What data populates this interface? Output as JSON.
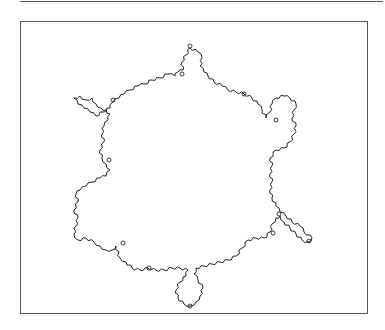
{
  "figure": {
    "stroke_color": "#222222",
    "frame_color": "#555555",
    "background": "#ffffff",
    "outline_points": [
      [
        190,
        48
      ],
      [
        186,
        55
      ],
      [
        182,
        62
      ],
      [
        183,
        70
      ],
      [
        178,
        72
      ],
      [
        175,
        76
      ],
      [
        168,
        74
      ],
      [
        160,
        78
      ],
      [
        152,
        80
      ],
      [
        145,
        84
      ],
      [
        138,
        86
      ],
      [
        130,
        90
      ],
      [
        124,
        94
      ],
      [
        119,
        98
      ],
      [
        113,
        102
      ],
      [
        110,
        108
      ],
      [
        103,
        112
      ],
      [
        96,
        116
      ],
      [
        90,
        112
      ],
      [
        84,
        108
      ],
      [
        78,
        104
      ],
      [
        74,
        98
      ],
      [
        80,
        96
      ],
      [
        86,
        100
      ],
      [
        92,
        98
      ],
      [
        96,
        104
      ],
      [
        101,
        108
      ],
      [
        106,
        110
      ],
      [
        110,
        114
      ],
      [
        108,
        120
      ],
      [
        104,
        126
      ],
      [
        102,
        134
      ],
      [
        104,
        142
      ],
      [
        100,
        150
      ],
      [
        102,
        158
      ],
      [
        106,
        164
      ],
      [
        110,
        170
      ],
      [
        106,
        176
      ],
      [
        100,
        178
      ],
      [
        92,
        182
      ],
      [
        86,
        186
      ],
      [
        80,
        190
      ],
      [
        76,
        194
      ],
      [
        78,
        202
      ],
      [
        74,
        210
      ],
      [
        78,
        218
      ],
      [
        76,
        226
      ],
      [
        74,
        234
      ],
      [
        78,
        240
      ],
      [
        86,
        238
      ],
      [
        94,
        242
      ],
      [
        100,
        246
      ],
      [
        106,
        250
      ],
      [
        112,
        250
      ],
      [
        116,
        246
      ],
      [
        120,
        258
      ],
      [
        126,
        262
      ],
      [
        132,
        268
      ],
      [
        140,
        270
      ],
      [
        148,
        268
      ],
      [
        156,
        270
      ],
      [
        164,
        270
      ],
      [
        172,
        268
      ],
      [
        180,
        268
      ],
      [
        188,
        270
      ],
      [
        186,
        276
      ],
      [
        180,
        282
      ],
      [
        176,
        290
      ],
      [
        178,
        298
      ],
      [
        184,
        304
      ],
      [
        190,
        306
      ],
      [
        196,
        302
      ],
      [
        200,
        296
      ],
      [
        203,
        288
      ],
      [
        198,
        280
      ],
      [
        194,
        274
      ],
      [
        196,
        268
      ],
      [
        204,
        266
      ],
      [
        212,
        264
      ],
      [
        220,
        262
      ],
      [
        228,
        260
      ],
      [
        236,
        256
      ],
      [
        242,
        248
      ],
      [
        248,
        240
      ],
      [
        256,
        238
      ],
      [
        264,
        238
      ],
      [
        270,
        232
      ],
      [
        272,
        224
      ],
      [
        276,
        218
      ],
      [
        280,
        216
      ],
      [
        284,
        222
      ],
      [
        290,
        228
      ],
      [
        296,
        234
      ],
      [
        302,
        240
      ],
      [
        308,
        242
      ],
      [
        312,
        238
      ],
      [
        304,
        232
      ],
      [
        300,
        226
      ],
      [
        292,
        222
      ],
      [
        286,
        216
      ],
      [
        280,
        212
      ],
      [
        276,
        206
      ],
      [
        272,
        198
      ],
      [
        270,
        190
      ],
      [
        272,
        182
      ],
      [
        270,
        174
      ],
      [
        272,
        166
      ],
      [
        270,
        158
      ],
      [
        276,
        150
      ],
      [
        284,
        148
      ],
      [
        290,
        142
      ],
      [
        294,
        134
      ],
      [
        296,
        126
      ],
      [
        292,
        118
      ],
      [
        294,
        110
      ],
      [
        296,
        104
      ],
      [
        290,
        98
      ],
      [
        284,
        96
      ],
      [
        276,
        98
      ],
      [
        272,
        104
      ],
      [
        270,
        112
      ],
      [
        266,
        118
      ],
      [
        262,
        110
      ],
      [
        258,
        104
      ],
      [
        252,
        98
      ],
      [
        244,
        94
      ],
      [
        236,
        92
      ],
      [
        228,
        90
      ],
      [
        222,
        86
      ],
      [
        214,
        82
      ],
      [
        208,
        76
      ],
      [
        204,
        72
      ],
      [
        200,
        66
      ],
      [
        202,
        58
      ],
      [
        198,
        52
      ]
    ],
    "small_loops": [
      [
        190,
        46
      ],
      [
        182,
        74
      ],
      [
        113,
        100
      ],
      [
        276,
        120
      ],
      [
        123,
        243
      ],
      [
        149,
        268
      ],
      [
        190,
        306
      ],
      [
        273,
        233
      ],
      [
        309,
        241
      ],
      [
        279,
        214
      ],
      [
        244,
        94
      ],
      [
        109,
        160
      ]
    ]
  }
}
